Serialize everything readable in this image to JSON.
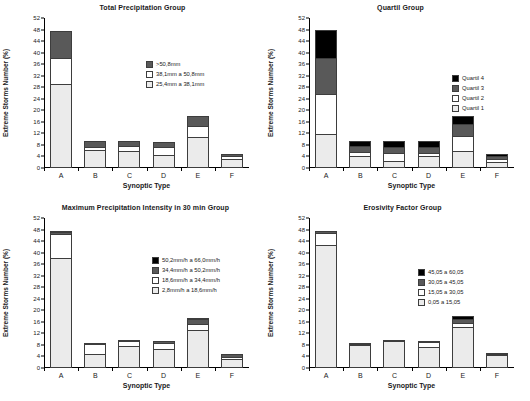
{
  "axis": {
    "ylabel": "Extreme Storms Number (%)",
    "xlabel": "Synoptic Type",
    "yticks": [
      0,
      4,
      8,
      12,
      16,
      20,
      24,
      28,
      32,
      36,
      40,
      44,
      48,
      52
    ],
    "categories": [
      "A",
      "B",
      "C",
      "D",
      "E",
      "F"
    ],
    "ylim": [
      0,
      52
    ]
  },
  "colors": {
    "black": "#000000",
    "darkgray": "#595959",
    "white": "#ffffff",
    "lightgray": "#ebebeb",
    "outline": "#3d3d3d"
  },
  "panels": [
    {
      "id": "total-precipitation-group",
      "title": "Total Precipitation Group",
      "legend": [
        {
          "label": ">50,8mm",
          "color": "#595959"
        },
        {
          "label": "38,1mm a 50,8mm",
          "color": "#ffffff"
        },
        {
          "label": "25,4mm a 38,1mm",
          "color": "#ebebeb"
        }
      ],
      "chart_data": {
        "type": "bar",
        "stacked": true,
        "title": "Total Precipitation Group",
        "xlabel": "Synoptic Type",
        "ylabel": "Extreme Storms Number (%)",
        "ylim": [
          0,
          52
        ],
        "grid": false,
        "legend_position": "right",
        "categories": [
          "A",
          "B",
          "C",
          "D",
          "E",
          "F"
        ],
        "series": [
          {
            "name": "25,4mm a 38,1mm",
            "color": "#ebebeb",
            "values": [
              29.0,
              6.3,
              5.9,
              4.6,
              10.9,
              3.2
            ]
          },
          {
            "name": "38,1mm a 50,8mm",
            "color": "#ffffff",
            "values": [
              9.0,
              1.0,
              1.9,
              2.8,
              3.6,
              1.0
            ]
          },
          {
            "name": ">50,8mm",
            "color": "#595959",
            "values": [
              9.5,
              1.9,
              1.5,
              1.6,
              3.4,
              0.6
            ]
          }
        ]
      }
    },
    {
      "id": "quartil-group",
      "title": "Quartil Group",
      "legend": [
        {
          "label": "Quartil 4",
          "color": "#000000"
        },
        {
          "label": "Quartil 3",
          "color": "#595959"
        },
        {
          "label": "Quartil 2",
          "color": "#ffffff"
        },
        {
          "label": "Quartil 1",
          "color": "#ebebeb"
        }
      ],
      "chart_data": {
        "type": "bar",
        "stacked": true,
        "title": "Quartil Group",
        "xlabel": "Synoptic Type",
        "ylabel": "Extreme Storms Number (%)",
        "ylim": [
          0,
          52
        ],
        "grid": false,
        "legend_position": "right",
        "categories": [
          "A",
          "B",
          "C",
          "D",
          "E",
          "F"
        ],
        "series": [
          {
            "name": "Quartil 1",
            "color": "#ebebeb",
            "values": [
              11.9,
              4.1,
              2.5,
              4.2,
              5.8,
              2.1
            ]
          },
          {
            "name": "Quartil 2",
            "color": "#ffffff",
            "values": [
              13.7,
              1.4,
              2.6,
              1.1,
              5.2,
              1.0
            ]
          },
          {
            "name": "Quartil 3",
            "color": "#595959",
            "values": [
              12.4,
              2.0,
              2.2,
              2.0,
              4.3,
              1.0
            ]
          },
          {
            "name": "Quartil 4",
            "color": "#000000",
            "values": [
              10.0,
              1.8,
              2.1,
              1.9,
              2.7,
              0.9
            ]
          }
        ]
      }
    },
    {
      "id": "maximum-precipitation-intensity-30min-group",
      "title": "Maximum Precipitation Intensity in 30 min Group",
      "legend": [
        {
          "label": "50,2mm/h a 66,0mm/h",
          "color": "#000000"
        },
        {
          "label": "34,4mm/h a 50,2mm/h",
          "color": "#595959"
        },
        {
          "label": "18,6mm/h a 34,4mm/h",
          "color": "#ffffff"
        },
        {
          "label": "2,8mm/h a 18,6mm/h",
          "color": "#ebebeb"
        }
      ],
      "chart_data": {
        "type": "bar",
        "stacked": true,
        "title": "Maximum Precipitation Intensity in 30 min Group",
        "xlabel": "Synoptic Type",
        "ylabel": "Extreme Storms Number (%)",
        "ylim": [
          0,
          52
        ],
        "grid": false,
        "legend_position": "right",
        "categories": [
          "A",
          "B",
          "C",
          "D",
          "E",
          "F"
        ],
        "series": [
          {
            "name": "2,8mm/h a 18,6mm/h",
            "color": "#ebebeb",
            "values": [
              38.0,
              5.0,
              7.7,
              6.6,
              13.2,
              3.1
            ]
          },
          {
            "name": "18,6mm/h a 34,4mm/h",
            "color": "#ffffff",
            "values": [
              8.4,
              3.2,
              1.6,
              2.0,
              2.2,
              0.6
            ]
          },
          {
            "name": "34,4mm/h a 50,2mm/h",
            "color": "#595959",
            "values": [
              0.9,
              0.6,
              0.3,
              0.7,
              1.5,
              1.0
            ]
          },
          {
            "name": "50,2mm/h a 66,0mm/h",
            "color": "#000000",
            "values": [
              0.2,
              0.0,
              0.0,
              0.0,
              0.2,
              0.0
            ]
          }
        ]
      }
    },
    {
      "id": "erosivity-factor-group",
      "title": "Erosivity Factor Group",
      "legend": [
        {
          "label": "45,05 a 60,05",
          "color": "#000000"
        },
        {
          "label": "30,05 a 45,05",
          "color": "#595959"
        },
        {
          "label": "15,05 a 30,05",
          "color": "#ffffff"
        },
        {
          "label": "0,05 a 15,05",
          "color": "#ebebeb"
        }
      ],
      "chart_data": {
        "type": "bar",
        "stacked": true,
        "title": "Erosivity Factor Group",
        "xlabel": "Synoptic Type",
        "ylabel": "Extreme Storms Number (%)",
        "ylim": [
          0,
          52
        ],
        "grid": false,
        "legend_position": "right",
        "categories": [
          "A",
          "B",
          "C",
          "D",
          "E",
          "F"
        ],
        "series": [
          {
            "name": "0,05 a 15,05",
            "color": "#ebebeb",
            "values": [
              42.6,
              7.9,
              9.4,
              7.2,
              14.2,
              4.4
            ]
          },
          {
            "name": "15,05 a 30,05",
            "color": "#ffffff",
            "values": [
              4.2,
              0.4,
              0.3,
              1.7,
              1.3,
              0.2
            ]
          },
          {
            "name": "30,05 a 45,05",
            "color": "#595959",
            "values": [
              0.6,
              0.4,
              0.0,
              0.2,
              1.6,
              0.3
            ]
          },
          {
            "name": "45,05 a 60,05",
            "color": "#000000",
            "values": [
              0.0,
              0.0,
              0.0,
              0.0,
              0.9,
              0.0
            ]
          }
        ]
      }
    }
  ]
}
